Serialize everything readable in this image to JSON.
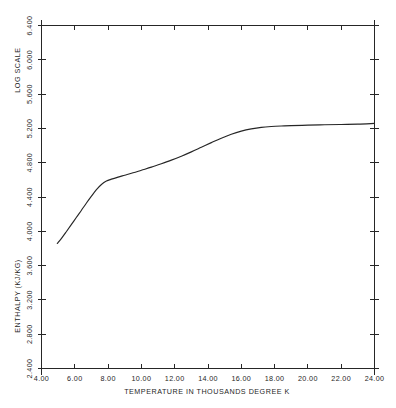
{
  "chart_data": {
    "type": "line",
    "title": "",
    "subtitle": "",
    "xlabel": "TEMPERATURE IN THOUSANDS DEGREE K",
    "ylabel": "ENTHALPY (KJ/KG)",
    "ylabel_note": "LOG SCALE",
    "xlim": [
      4.0,
      24.0
    ],
    "ylim": [
      2.4,
      6.4
    ],
    "xticks": [
      4.0,
      6.0,
      8.0,
      10.0,
      12.0,
      14.0,
      16.0,
      18.0,
      20.0,
      22.0,
      24.0
    ],
    "yticks": [
      2.4,
      2.8,
      3.2,
      3.6,
      4.0,
      4.4,
      4.8,
      5.2,
      5.6,
      6.0,
      6.4
    ],
    "xticklabels": [
      "4.00",
      "6.00",
      "8.00",
      "10.00",
      "12.00",
      "14.00",
      "16.00",
      "18.00",
      "20.00",
      "22.00",
      "24.00"
    ],
    "yticklabels": [
      "2.400",
      "2.800",
      "3.200",
      "3.600",
      "4.000",
      "4.400",
      "4.800",
      "5.200",
      "5.600",
      "6.000",
      "6.400"
    ],
    "grid": false,
    "legend": false,
    "legend_position": "none",
    "line_color": "#262626",
    "frame_color": "#262626",
    "background_color": "#ffffff",
    "series": [
      {
        "name": "enthalpy",
        "x": [
          4.95,
          5.2,
          5.5,
          5.8,
          6.1,
          6.4,
          6.7,
          7.0,
          7.3,
          7.6,
          7.9,
          8.2,
          8.6,
          9.0,
          9.5,
          10.0,
          10.6,
          11.2,
          11.8,
          12.4,
          13.0,
          13.6,
          14.2,
          14.8,
          15.4,
          16.0,
          16.6,
          17.2,
          17.8,
          18.4,
          19.0,
          20.0,
          21.0,
          22.0,
          23.0,
          24.0
        ],
        "y": [
          3.858,
          3.918,
          3.998,
          4.08,
          4.164,
          4.246,
          4.33,
          4.41,
          4.486,
          4.546,
          4.586,
          4.608,
          4.632,
          4.654,
          4.682,
          4.712,
          4.748,
          4.788,
          4.83,
          4.876,
          4.926,
          4.98,
          5.034,
          5.086,
          5.132,
          5.168,
          5.194,
          5.212,
          5.222,
          5.228,
          5.232,
          5.238,
          5.242,
          5.246,
          5.25,
          5.258
        ]
      }
    ]
  },
  "axes": {
    "x_tick_labels": [
      "4.00",
      "6.00",
      "8.00",
      "10.00",
      "12.00",
      "14.00",
      "16.00",
      "18.00",
      "20.00",
      "22.00",
      "24.00"
    ],
    "y_tick_labels": [
      "2.400",
      "2.800",
      "3.200",
      "3.600",
      "4.000",
      "4.400",
      "4.800",
      "5.200",
      "5.600",
      "6.000",
      "6.400"
    ],
    "x_axis_title": "TEMPERATURE IN THOUSANDS DEGREE K",
    "y_axis_title": "ENTHALPY (KJ/KG)",
    "y_axis_scale_note": "LOG SCALE"
  }
}
